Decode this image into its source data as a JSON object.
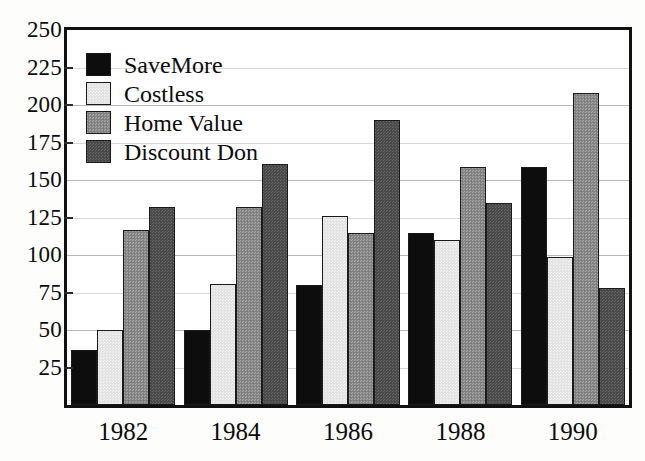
{
  "chart_data": {
    "type": "bar",
    "title": "",
    "xlabel": "",
    "ylabel": "",
    "categories": [
      "1982",
      "1984",
      "1986",
      "1988",
      "1990"
    ],
    "series": [
      {
        "name": "SaveMore",
        "color": "#0d0d0d",
        "values": [
          37,
          50,
          80,
          115,
          159
        ]
      },
      {
        "name": "Costless",
        "color": "#e3e3e3",
        "values": [
          50,
          81,
          126,
          110,
          99
        ]
      },
      {
        "name": "Home Value",
        "color": "#8a8a8a",
        "values": [
          117,
          132,
          115,
          159,
          208
        ]
      },
      {
        "name": "Discount Don",
        "color": "#4a4a4a",
        "values": [
          132,
          161,
          190,
          135,
          78
        ]
      }
    ],
    "ylim": [
      0,
      250
    ],
    "yticks": [
      25,
      50,
      75,
      100,
      125,
      150,
      175,
      200,
      225,
      250
    ],
    "ytick_labels": [
      "25",
      "50",
      "75",
      "100",
      "125",
      "150",
      "175",
      "200",
      "225",
      "250"
    ],
    "grid": true,
    "legend_position": "top-left"
  }
}
